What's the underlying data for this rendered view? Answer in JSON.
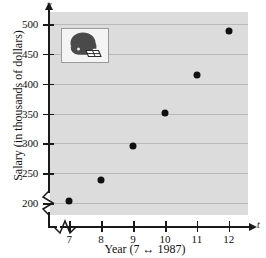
{
  "chart_data": {
    "type": "scatter",
    "title": "",
    "xlabel": "Year (7 ↔ 1987)",
    "ylabel": "Salary (in thousands of dollars)",
    "x_axis_symbol": "t",
    "y_axis_symbol": "y",
    "x": [
      7,
      8,
      9,
      10,
      11,
      12
    ],
    "values": [
      203,
      239,
      295,
      351,
      415,
      488
    ],
    "xtick_labels": [
      "7",
      "8",
      "9",
      "10",
      "11",
      "12"
    ],
    "ytick_labels": [
      "200",
      "250",
      "300",
      "350",
      "400",
      "450",
      "500"
    ],
    "yticks": [
      200,
      250,
      300,
      350,
      400,
      450,
      500
    ],
    "xlim": [
      6.4,
      12.6
    ],
    "ylim": [
      180,
      520
    ],
    "grid": "horizontal",
    "legend": "none",
    "axis_break_x": true,
    "axis_break_y": true,
    "plot_background": "#dcdcdc",
    "gridline_color": "#b9b9b9",
    "marker_color": "#111111",
    "series": [
      {
        "name": "Average NFL salary",
        "points": [
          {
            "x": 7,
            "y": 203
          },
          {
            "x": 8,
            "y": 239
          },
          {
            "x": 9,
            "y": 295
          },
          {
            "x": 10,
            "y": 351
          },
          {
            "x": 11,
            "y": 415
          },
          {
            "x": 12,
            "y": 488
          }
        ]
      }
    ]
  },
  "inset": {
    "name": "football-helmet",
    "helmet_color": "#4a4a4a",
    "facemask_color": "#ffffff"
  }
}
